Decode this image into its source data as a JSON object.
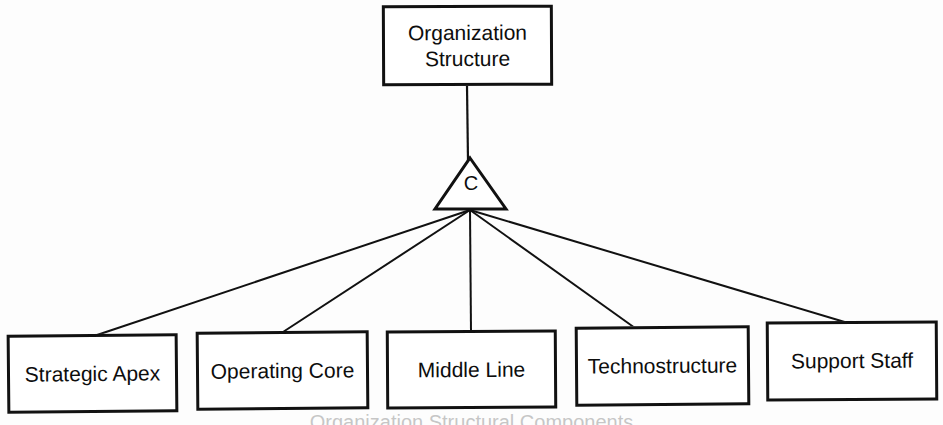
{
  "diagram": {
    "title": "Organization Structure",
    "root": {
      "label": "Organization\nStructure"
    },
    "hub": {
      "shape": "triangle",
      "label": "C"
    },
    "leaves": [
      {
        "label": "Strategic Apex"
      },
      {
        "label": "Operating Core"
      },
      {
        "label": "Middle Line"
      },
      {
        "label": "Technostructure"
      },
      {
        "label": "Support Staff"
      }
    ],
    "caption": "Organization Structural Components",
    "colors": {
      "stroke": "#111111",
      "fill": "#ffffff",
      "text": "#0d0d0d",
      "background": "#fdfdfd"
    }
  }
}
